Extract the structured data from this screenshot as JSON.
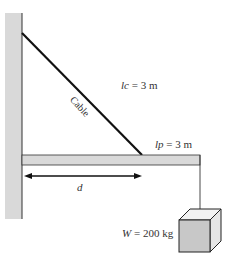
{
  "diagram": {
    "labels": {
      "cable": "Cable",
      "lc_var": "lc",
      "lc_value": " = 3 m",
      "lp_var": "lp",
      "lp_value": " = 3 m",
      "d": "d",
      "w_var": "W",
      "w_value": " = 200 kg"
    },
    "colors": {
      "wall": "#d9d9d9",
      "beam": "#d9d9d9",
      "line": "#1a1a1a",
      "box_front": "#c8c8c8",
      "box_top": "#f2f2f2",
      "box_side": "#e6e6e6"
    }
  }
}
